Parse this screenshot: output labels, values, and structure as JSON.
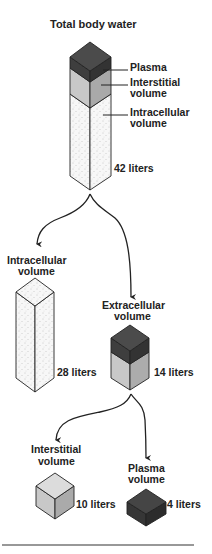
{
  "title": "Total body water",
  "total": {
    "labels": {
      "plasma": "Plasma",
      "interstitial_line1": "Interstitial",
      "interstitial_line2": "volume",
      "intracellular_line1": "Intracellular",
      "intracellular_line2": "volume"
    },
    "volume": "42 liters"
  },
  "intracellular": {
    "label_line1": "Intracellular",
    "label_line2": "volume",
    "volume": "28 liters"
  },
  "extracellular": {
    "label_line1": "Extracellular",
    "label_line2": "volume",
    "volume": "14 liters"
  },
  "interstitial": {
    "label_line1": "Interstitial",
    "label_line2": "volume",
    "volume": "10 liters"
  },
  "plasma": {
    "label_line1": "Plasma",
    "label_line2": "volume",
    "volume": "4 liters"
  },
  "colors": {
    "plasma_top": "#4a4a4a",
    "plasma_left": "#3a3a3a",
    "plasma_right": "#2e2e2e",
    "interstitial_top": "#d8d8d8",
    "interstitial_left": "#c4c4c4",
    "interstitial_right": "#a8a8a8",
    "intracellular_fill": "#f4f4f4",
    "outline": "#222222"
  }
}
